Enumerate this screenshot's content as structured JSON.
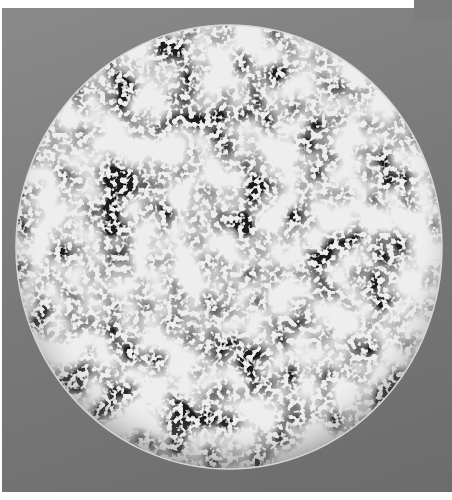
{
  "image": {
    "subject": "sphere with cellular lattice pattern",
    "background_color": "#7a7a7a",
    "sphere": {
      "cx": 229,
      "cy": 247,
      "rx": 213,
      "ry": 222
    },
    "pattern_colors": {
      "light": "#efefef",
      "dark": "#1a1a1a"
    }
  }
}
